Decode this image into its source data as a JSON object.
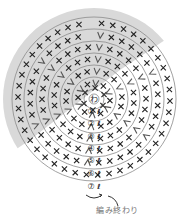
{
  "diagram": {
    "type": "crochet-round-chart",
    "center": {
      "x": 94,
      "y": 99
    },
    "colors": {
      "shade": "#d9d9d9",
      "ring": "#8a8a8a",
      "symbol": "#222222",
      "vsymbol": "#555555"
    },
    "center_label": "わ",
    "ring_radii": [
      10,
      22,
      34,
      46,
      58,
      70,
      82
    ],
    "rows": [
      {
        "label": "①",
        "y": 111,
        "x": 91
      },
      {
        "label": "②",
        "y": 123,
        "x": 91
      },
      {
        "label": "③",
        "y": 136,
        "x": 91
      },
      {
        "label": "④",
        "y": 148,
        "x": 91
      },
      {
        "label": "⑤",
        "y": 160,
        "x": 91
      },
      {
        "label": "⑥",
        "y": 173,
        "x": 91
      },
      {
        "label": "⑦",
        "y": 186,
        "x": 91
      }
    ],
    "end_label": "編み終わり",
    "legend_symbols": {
      "x": "single crochet (×)",
      "v": "increase (V)",
      "chain": "chain start"
    }
  }
}
